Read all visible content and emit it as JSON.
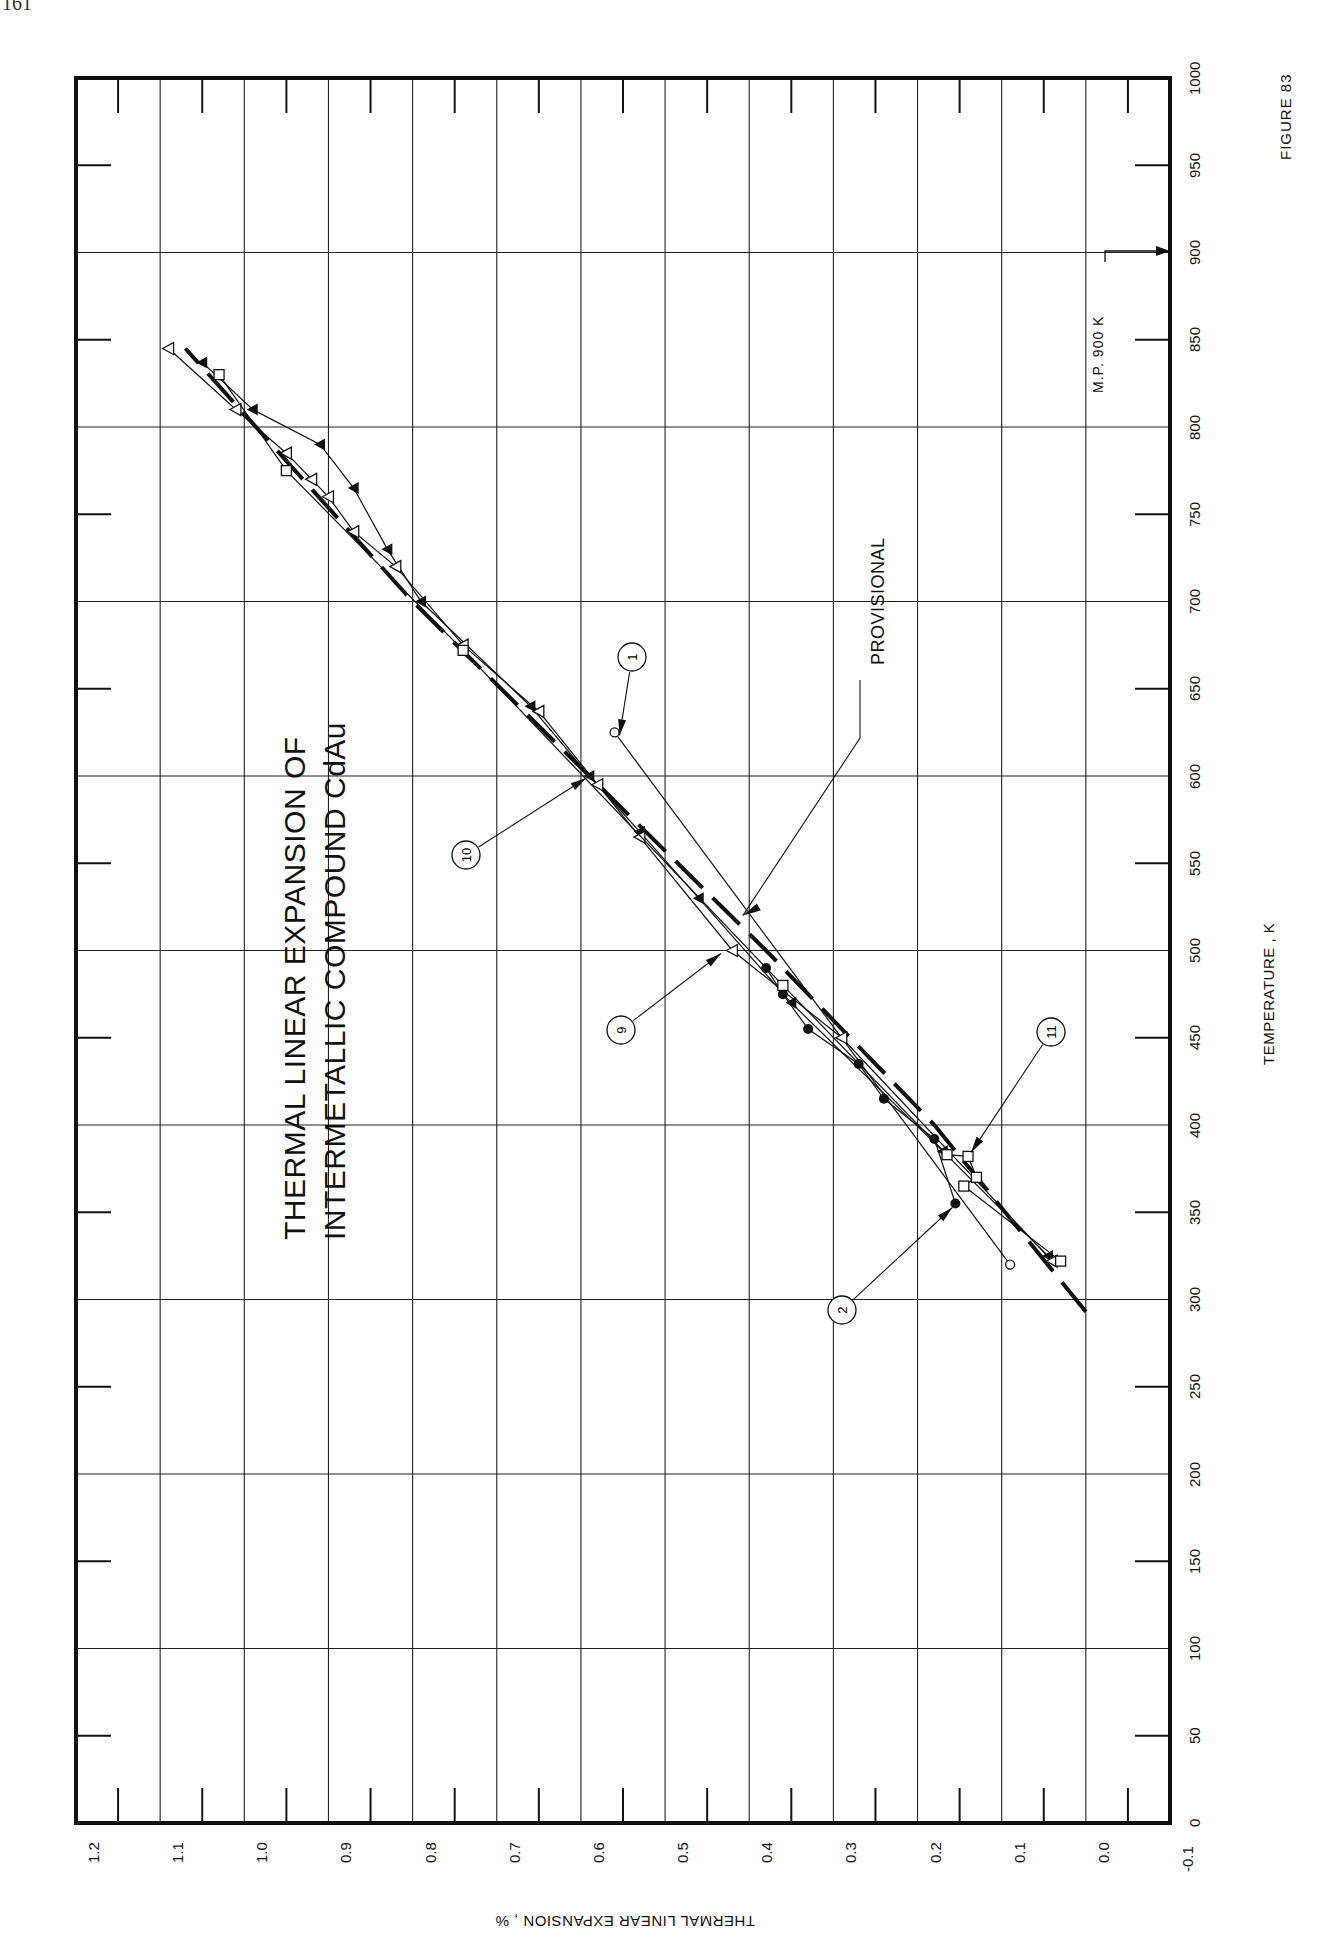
{
  "page": {
    "number": "161"
  },
  "figure": {
    "label": "FIGURE 83"
  },
  "title": {
    "line1": "THERMAL LINEAR EXPANSION OF",
    "line2": "INTERMETALLIC COMPOUND CdAu"
  },
  "annotations": {
    "provisional": "PROVISIONAL",
    "melting_point": "M.P. 900 K"
  },
  "chart_data": {
    "type": "line",
    "orientation": "rotated 90 degrees clockwise (temperature axis vertical on right, expansion axis horizontal at bottom)",
    "xlabel": "TEMPERATURE , K",
    "ylabel": "THERMAL LINEAR EXPANSION , %",
    "xlim": [
      0,
      1000
    ],
    "ylim": [
      -0.1,
      1.2
    ],
    "x_ticks": [
      "0",
      "50",
      "100",
      "150",
      "200",
      "250",
      "300",
      "350",
      "400",
      "450",
      "500",
      "550",
      "600",
      "650",
      "700",
      "750",
      "800",
      "850",
      "900",
      "950",
      "1000"
    ],
    "y_ticks": [
      "1.2",
      "1.1",
      "1.0",
      "0.9",
      "0.8",
      "0.7",
      "0.6",
      "0.5",
      "0.4",
      "0.3",
      "0.2",
      "0.1",
      "0.0",
      "-0.1"
    ],
    "grid": true,
    "melting_point_K": 900,
    "series": [
      {
        "name": "Provisional",
        "style": "dashed-bold",
        "points": [
          [
            293,
            0.0
          ],
          [
            400,
            0.18
          ],
          [
            500,
            0.38
          ],
          [
            600,
            0.59
          ],
          [
            700,
            0.8
          ],
          [
            845,
            1.07
          ]
        ]
      },
      {
        "name": "1",
        "marker": "open-circle",
        "points": [
          [
            320,
            0.09
          ],
          [
            625,
            0.56
          ]
        ]
      },
      {
        "name": "2",
        "marker": "filled-circle",
        "points": [
          [
            355,
            0.155
          ],
          [
            392,
            0.18
          ],
          [
            415,
            0.24
          ],
          [
            435,
            0.27
          ],
          [
            455,
            0.33
          ],
          [
            475,
            0.36
          ],
          [
            490,
            0.38
          ]
        ]
      },
      {
        "name": "9",
        "marker": "filled-triangle",
        "points": [
          [
            325,
            0.045
          ],
          [
            385,
            0.17
          ],
          [
            470,
            0.35
          ],
          [
            530,
            0.46
          ],
          [
            568,
            0.53
          ],
          [
            600,
            0.59
          ],
          [
            640,
            0.66
          ],
          [
            700,
            0.79
          ],
          [
            730,
            0.83
          ],
          [
            765,
            0.87
          ],
          [
            790,
            0.91
          ],
          [
            810,
            0.99
          ],
          [
            837,
            1.05
          ]
        ]
      },
      {
        "name": "10",
        "marker": "open-triangle",
        "points": [
          [
            322,
            0.04
          ],
          [
            450,
            0.29
          ],
          [
            500,
            0.42
          ],
          [
            565,
            0.53
          ],
          [
            595,
            0.58
          ],
          [
            637,
            0.65
          ],
          [
            675,
            0.74
          ],
          [
            720,
            0.82
          ],
          [
            740,
            0.87
          ],
          [
            760,
            0.9
          ],
          [
            770,
            0.92
          ],
          [
            785,
            0.95
          ],
          [
            810,
            1.01
          ],
          [
            845,
            1.09
          ]
        ]
      },
      {
        "name": "11",
        "marker": "open-square",
        "points": [
          [
            322,
            0.03
          ],
          [
            365,
            0.145
          ],
          [
            370,
            0.13
          ],
          [
            382,
            0.14
          ],
          [
            383,
            0.165
          ],
          [
            480,
            0.36
          ],
          [
            672,
            0.74
          ],
          [
            775,
            0.95
          ],
          [
            830,
            1.03
          ]
        ]
      }
    ]
  },
  "reference_labels": [
    "1",
    "2",
    "9",
    "10",
    "11"
  ]
}
